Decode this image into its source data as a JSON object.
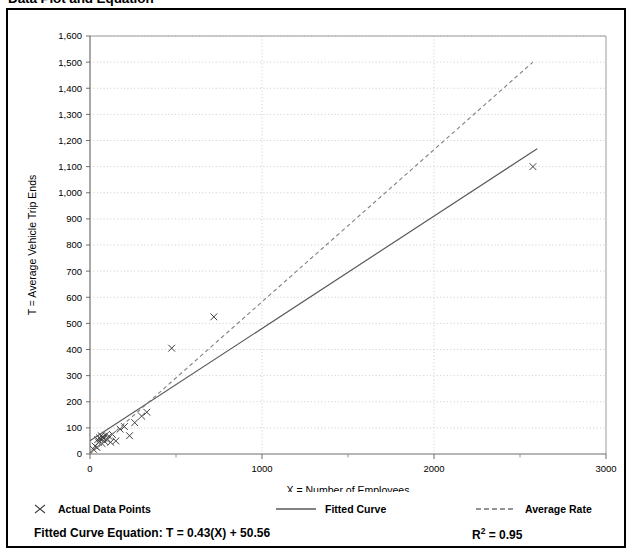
{
  "title": "Data Plot and Equation",
  "legend": {
    "points": {
      "label": "Actual Data Points",
      "glyph": "x-marker-icon"
    },
    "fitted": {
      "label": "Fitted Curve",
      "glyph": "solid-line-icon"
    },
    "average": {
      "label": "Average Rate",
      "glyph": "dashed-line-icon"
    }
  },
  "equation": {
    "label": "Fitted Curve Equation:  T = 0.43(X) + 50.56",
    "r_squared_prefix": "R",
    "r_squared_exp": "2",
    "r_squared_value": " = 0.95"
  },
  "colors": {
    "frame": "#000000",
    "axis": "#808080",
    "grid": "#bfbfbf",
    "fitted_curve": "#595959",
    "average_rate": "#808080",
    "marker": "#404040",
    "text": "#000000",
    "background": "#ffffff"
  },
  "chart_data": {
    "type": "scatter",
    "title": "Data Plot and Equation",
    "xlabel": "X = Number of Employees",
    "ylabel": "T = Average Vehicle Trip Ends",
    "xlim": [
      0,
      3000
    ],
    "ylim": [
      0,
      1600
    ],
    "xticks": [
      0,
      1000,
      2000,
      3000
    ],
    "xtick_labels": [
      "0",
      "1000",
      "2000",
      "3000"
    ],
    "xminor_ticks": [
      500,
      1500,
      2500
    ],
    "yticks": [
      0,
      100,
      200,
      300,
      400,
      500,
      600,
      700,
      800,
      900,
      1000,
      1100,
      1200,
      1300,
      1400,
      1500,
      1600
    ],
    "ytick_labels": [
      "0",
      "100",
      "200",
      "300",
      "400",
      "500",
      "600",
      "700",
      "800",
      "900",
      "1,000",
      "1,100",
      "1,200",
      "1,300",
      "1,400",
      "1,500",
      "1,600"
    ],
    "grid": true,
    "grid_style": "dotted",
    "legend_position": "below",
    "series": [
      {
        "name": "Actual Data Points",
        "type": "scatter",
        "marker": "x",
        "points": [
          [
            20,
            18
          ],
          [
            30,
            30
          ],
          [
            40,
            25
          ],
          [
            45,
            55
          ],
          [
            50,
            45
          ],
          [
            55,
            62
          ],
          [
            60,
            58
          ],
          [
            65,
            70
          ],
          [
            70,
            40
          ],
          [
            75,
            65
          ],
          [
            80,
            60
          ],
          [
            85,
            48
          ],
          [
            90,
            72
          ],
          [
            100,
            55
          ],
          [
            110,
            68
          ],
          [
            120,
            45
          ],
          [
            130,
            75
          ],
          [
            150,
            50
          ],
          [
            175,
            95
          ],
          [
            200,
            105
          ],
          [
            230,
            70
          ],
          [
            260,
            120
          ],
          [
            300,
            145
          ],
          [
            330,
            160
          ],
          [
            475,
            405
          ],
          [
            720,
            525
          ],
          [
            2575,
            1100
          ]
        ]
      },
      {
        "name": "Fitted Curve",
        "type": "line",
        "style": "solid",
        "equation": "T = 0.43(X) + 50.56",
        "slope": 0.43,
        "intercept": 50.56,
        "r_squared": 0.95,
        "endpoints": [
          [
            0,
            50.56
          ],
          [
            2600,
            1168.56
          ]
        ]
      },
      {
        "name": "Average Rate",
        "type": "line",
        "style": "dashed",
        "slope": 0.5825,
        "intercept": 0,
        "endpoints": [
          [
            0,
            0
          ],
          [
            2575,
            1500
          ]
        ]
      }
    ]
  }
}
